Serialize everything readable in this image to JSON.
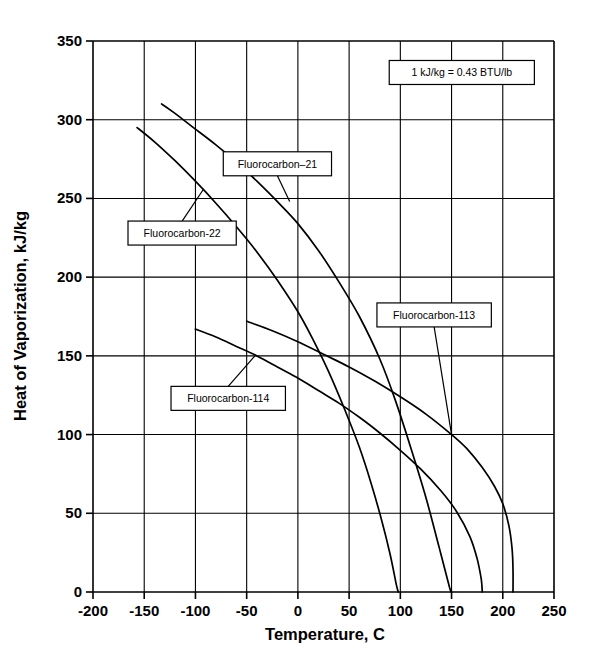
{
  "chart_data": {
    "type": "line",
    "title": "",
    "xlabel": "Temperature, C",
    "ylabel": "Heat of Vaporization, kJ/kg",
    "xlim": [
      -200,
      250
    ],
    "ylim": [
      0,
      350
    ],
    "xticks": [
      -200,
      -150,
      -100,
      -50,
      0,
      50,
      100,
      150,
      200,
      250
    ],
    "yticks": [
      0,
      50,
      100,
      150,
      200,
      250,
      300,
      350
    ],
    "xtick_labels": [
      "-200",
      "-150",
      "-100",
      "-50",
      "0",
      "50",
      "100",
      "150",
      "200",
      "250"
    ],
    "ytick_labels": [
      "0",
      "50",
      "100",
      "150",
      "200",
      "250",
      "300",
      "350"
    ],
    "grid": true,
    "legend": "none",
    "annotations": [
      {
        "name": "unit-conversion-note",
        "text": "1 kJ/kg = 0.43 BTU/lb",
        "x": 160,
        "y": 330
      }
    ],
    "series": [
      {
        "name": "Fluorocarbon-21",
        "label": "Fluorocarbon–21",
        "label_x": -20,
        "label_y": 272,
        "points": [
          [
            -133,
            310
          ],
          [
            -120,
            304
          ],
          [
            -100,
            294
          ],
          [
            -80,
            284
          ],
          [
            -60,
            273
          ],
          [
            -40,
            261
          ],
          [
            -20,
            248
          ],
          [
            0,
            234
          ],
          [
            20,
            217
          ],
          [
            40,
            197
          ],
          [
            60,
            175
          ],
          [
            80,
            148
          ],
          [
            95,
            122
          ],
          [
            110,
            92
          ],
          [
            125,
            60
          ],
          [
            138,
            28
          ],
          [
            148,
            3
          ],
          [
            150,
            0
          ]
        ]
      },
      {
        "name": "Fluorocarbon-22",
        "label": "Fluorocarbon-22",
        "label_x": -113,
        "label_y": 228,
        "points": [
          [
            -157,
            295
          ],
          [
            -140,
            286
          ],
          [
            -120,
            274
          ],
          [
            -100,
            261
          ],
          [
            -80,
            247
          ],
          [
            -60,
            232
          ],
          [
            -40,
            216
          ],
          [
            -20,
            198
          ],
          [
            0,
            178
          ],
          [
            15,
            160
          ],
          [
            30,
            140
          ],
          [
            45,
            117
          ],
          [
            60,
            92
          ],
          [
            72,
            68
          ],
          [
            82,
            45
          ],
          [
            90,
            24
          ],
          [
            96,
            5
          ],
          [
            98,
            0
          ]
        ]
      },
      {
        "name": "Fluorocarbon-113",
        "label": "Fluorocarbon-113",
        "label_x": 133,
        "label_y": 176,
        "points": [
          [
            -50,
            172
          ],
          [
            -25,
            166
          ],
          [
            0,
            159
          ],
          [
            25,
            151
          ],
          [
            50,
            143
          ],
          [
            75,
            134
          ],
          [
            100,
            124
          ],
          [
            125,
            113
          ],
          [
            150,
            100
          ],
          [
            165,
            91
          ],
          [
            180,
            79
          ],
          [
            192,
            67
          ],
          [
            200,
            56
          ],
          [
            206,
            42
          ],
          [
            209,
            28
          ],
          [
            210,
            14
          ],
          [
            210,
            0
          ]
        ]
      },
      {
        "name": "Fluorocarbon-114",
        "label": "Fluorocarbon-114",
        "label_x": -68,
        "label_y": 123,
        "points": [
          [
            -100,
            167
          ],
          [
            -80,
            162
          ],
          [
            -60,
            156
          ],
          [
            -40,
            150
          ],
          [
            -20,
            143
          ],
          [
            0,
            136
          ],
          [
            20,
            128
          ],
          [
            40,
            120
          ],
          [
            60,
            111
          ],
          [
            80,
            101
          ],
          [
            100,
            90
          ],
          [
            120,
            78
          ],
          [
            140,
            64
          ],
          [
            155,
            51
          ],
          [
            168,
            35
          ],
          [
            175,
            21
          ],
          [
            179,
            8
          ],
          [
            180,
            0
          ]
        ]
      }
    ]
  }
}
